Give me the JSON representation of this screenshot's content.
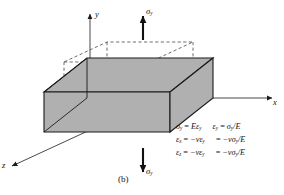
{
  "figure": {
    "caption": "(b)",
    "background_color": "#ffffff",
    "body_fill_color": "#b0b0b0",
    "line_color": "#1a1a1a",
    "dashed_line_color": "#4a4a4a"
  },
  "axes": {
    "y": {
      "label": "y",
      "direction": "up"
    },
    "x": {
      "label": "x",
      "direction": "right"
    },
    "z": {
      "label": "z",
      "direction": "down-left"
    }
  },
  "loads": [
    {
      "name": "stress-arrow-top",
      "label": "σ",
      "subscript": "y",
      "direction": "up"
    },
    {
      "name": "stress-arrow-bottom",
      "label": "σ",
      "subscript": "y",
      "direction": "down"
    }
  ],
  "equations": [
    {
      "left": {
        "lhs": "σ",
        "lhs_sub": "y",
        "eq": "=",
        "rhs": "Eε",
        "rhs_sub": "y"
      },
      "right": {
        "lhs": "ε",
        "lhs_sub": "y",
        "eq": "=",
        "rhs": "σ",
        "rhs_sub": "y",
        "tail": "/E"
      }
    },
    {
      "left": {
        "lhs": "ε",
        "lhs_sub": "x",
        "eq": "=",
        "rhs": "−νε",
        "rhs_sub": "y"
      },
      "right": {
        "eq": "=",
        "rhs": "−νσ",
        "rhs_sub": "y",
        "tail": "/E"
      }
    },
    {
      "left": {
        "lhs": "ε",
        "lhs_sub": "z",
        "eq": "=",
        "rhs": "−νε",
        "rhs_sub": "y"
      },
      "right": {
        "eq": "=",
        "rhs": "−νσ",
        "rhs_sub": "y",
        "tail": "/E"
      }
    }
  ],
  "equation_text": {
    "line1": "σy = Eεy    εy = σy/E",
    "line2": "εx = −νεy = −νσy/E",
    "line3": "εz = −νεy = −νσy/E"
  },
  "solid_body": {
    "name": "deformed-block",
    "style": "solid",
    "description": "flattened widened block after applying tensile stress"
  },
  "dashed_body": {
    "name": "original-cube",
    "style": "dashed",
    "description": "undeformed original cube outline"
  }
}
